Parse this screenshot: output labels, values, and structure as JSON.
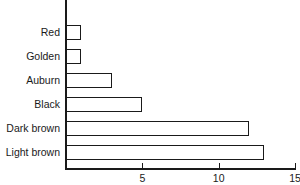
{
  "chart_data": {
    "type": "bar",
    "orientation": "horizontal",
    "title": "",
    "xlabel": "",
    "ylabel": "",
    "categories": [
      "Red",
      "Golden",
      "Auburn",
      "Black",
      "Dark brown",
      "Light brown"
    ],
    "values": [
      1,
      1,
      3,
      5,
      12,
      13
    ],
    "xlim": [
      0,
      15
    ],
    "xticks": [
      5,
      10,
      15
    ],
    "xtick_labels": [
      "5",
      "10",
      "15"
    ],
    "grid": false,
    "legend": null,
    "bar_fill": "#ffffff",
    "bar_edge": "#1a1a1a"
  }
}
